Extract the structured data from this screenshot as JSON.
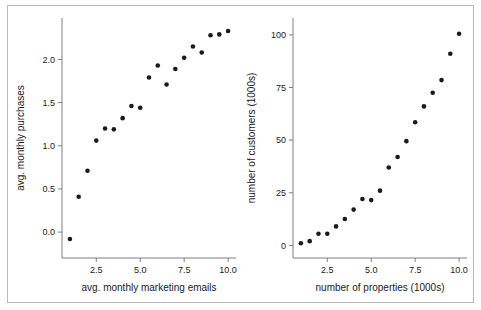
{
  "figure": {
    "background_color": "#ffffff",
    "frame_color": "#b8b8b8",
    "point_color": "#1a1a1a",
    "axis_color": "#7f7f7f"
  },
  "chart_data": [
    {
      "type": "scatter",
      "title": "",
      "xlabel": "avg. monthly marketing emails",
      "ylabel": "avg. monthly purchases",
      "xlim": [
        0.55,
        10.45
      ],
      "ylim": [
        -0.3,
        2.48
      ],
      "xticks": [
        2.5,
        5.0,
        7.5,
        10.0
      ],
      "xticklabels": [
        "2.5",
        "5.0",
        "7.5",
        "10.0"
      ],
      "yticks": [
        0.0,
        0.5,
        1.0,
        1.5,
        2.0
      ],
      "yticklabels": [
        "0.0",
        "0.5",
        "1.0",
        "1.5",
        "2.0"
      ],
      "grid": false,
      "legend": "none",
      "x": [
        1.0,
        1.5,
        2.0,
        2.5,
        3.0,
        3.5,
        4.0,
        4.5,
        5.0,
        5.5,
        6.0,
        6.5,
        7.0,
        7.5,
        8.0,
        8.5,
        9.0,
        9.5,
        10.0
      ],
      "y": [
        -0.08,
        0.41,
        0.71,
        1.06,
        1.2,
        1.19,
        1.32,
        1.46,
        1.44,
        1.79,
        1.93,
        1.71,
        1.89,
        2.02,
        2.15,
        2.08,
        2.28,
        2.29,
        2.33
      ]
    },
    {
      "type": "scatter",
      "title": "",
      "xlabel": "number of properties (1000s)",
      "ylabel": "number of customers (1000s)",
      "xlim": [
        0.55,
        10.45
      ],
      "ylim": [
        -6,
        108
      ],
      "xticks": [
        2.5,
        5.0,
        7.5,
        10.0
      ],
      "xticklabels": [
        "2.5",
        "5.0",
        "7.5",
        "10.0"
      ],
      "yticks": [
        0,
        25,
        50,
        75,
        100
      ],
      "yticklabels": [
        "0",
        "25",
        "50",
        "75",
        "100"
      ],
      "grid": false,
      "legend": "none",
      "x": [
        1.0,
        1.5,
        2.0,
        2.5,
        3.0,
        3.5,
        4.0,
        4.5,
        5.0,
        5.5,
        6.0,
        6.5,
        7.0,
        7.5,
        8.0,
        8.5,
        9.0,
        9.5,
        10.0
      ],
      "y": [
        1.0,
        2.0,
        5.5,
        5.5,
        9.0,
        12.5,
        17.0,
        22.0,
        21.5,
        26.0,
        37.0,
        42.0,
        49.5,
        58.5,
        66.0,
        72.5,
        78.5,
        91.0,
        100.5
      ]
    }
  ]
}
